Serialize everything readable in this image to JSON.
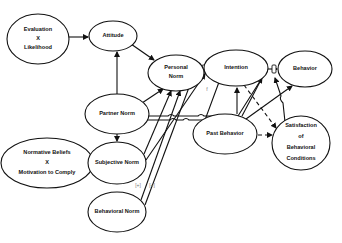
{
  "diagram": {
    "nodes": [
      {
        "id": "eval_likelihood",
        "lines": [
          "Evaluation",
          "X",
          "Likelihood"
        ]
      },
      {
        "id": "attitude",
        "lines": [
          "Attitude"
        ]
      },
      {
        "id": "personal_norm",
        "lines": [
          "Personal",
          "Norm"
        ]
      },
      {
        "id": "intention",
        "lines": [
          "Intention"
        ]
      },
      {
        "id": "behavior",
        "lines": [
          "Behavior"
        ]
      },
      {
        "id": "partner_norm",
        "lines": [
          "Partner Norm"
        ]
      },
      {
        "id": "past_behavior",
        "lines": [
          "Past Behavior"
        ]
      },
      {
        "id": "satisfaction",
        "lines": [
          "Satisfaction",
          "of",
          "Behavioral",
          "Conditions"
        ]
      },
      {
        "id": "normative_beliefs",
        "lines": [
          "Normative Beliefs",
          "X",
          "Motivation to Comply"
        ]
      },
      {
        "id": "subjective_norm",
        "lines": [
          "Subjective Norm"
        ]
      },
      {
        "id": "behavioral_norm",
        "lines": [
          "Behavioral Norm"
        ]
      }
    ],
    "edge_labels": {
      "f1": "f",
      "f2": "f",
      "plus1": "[+]",
      "plus2": "[+]"
    },
    "edges": [
      {
        "from": "eval_likelihood",
        "to": "attitude",
        "style": "solid"
      },
      {
        "from": "attitude",
        "to": "personal_norm",
        "style": "solid"
      },
      {
        "from": "partner_norm",
        "to": "attitude",
        "style": "solid"
      },
      {
        "from": "partner_norm",
        "to": "personal_norm",
        "style": "solid"
      },
      {
        "from": "partner_norm",
        "to": "subjective_norm",
        "style": "solid"
      },
      {
        "from": "partner_norm",
        "to": "intention-moderator",
        "style": "solid"
      },
      {
        "from": "partner_norm",
        "to": "behavior-moderator",
        "style": "solid"
      },
      {
        "from": "normative_beliefs",
        "to": "subjective_norm",
        "style": "solid"
      },
      {
        "from": "subjective_norm",
        "to": "personal_norm",
        "style": "solid"
      },
      {
        "from": "behavioral_norm",
        "to": "personal_norm",
        "style": "solid"
      },
      {
        "from": "behavioral_norm",
        "to": "intention-moderator",
        "style": "solid"
      },
      {
        "from": "personal_norm",
        "to": "intention",
        "style": "solid"
      },
      {
        "from": "intention",
        "to": "behavior",
        "style": "solid"
      },
      {
        "from": "past_behavior",
        "to": "intention",
        "style": "solid"
      },
      {
        "from": "past_behavior",
        "to": "behavior",
        "style": "solid"
      },
      {
        "from": "past_behavior",
        "to": "behavior-moderator",
        "style": "solid"
      },
      {
        "from": "past_behavior",
        "to": "satisfaction",
        "style": "dashed"
      },
      {
        "from": "intention",
        "to": "satisfaction",
        "style": "dashed"
      },
      {
        "from": "satisfaction",
        "to": "behavior-moderator",
        "style": "solid"
      }
    ]
  }
}
